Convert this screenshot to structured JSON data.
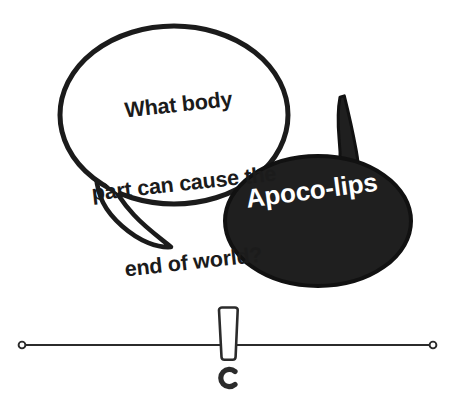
{
  "canvas": {
    "width": 461,
    "height": 411,
    "background_color": "#ffffff"
  },
  "comic": {
    "title_alt": "Apoco-lips pun joke comic with two speech bubbles",
    "question_bubble": {
      "name": "question-speech-bubble",
      "style": "outlined-white-oval-with-curved-tail",
      "fill_color": "#ffffff",
      "stroke_color": "#1b1b1b",
      "text_color": "#1b1b1b",
      "lines": [
        "What body",
        "part can cause the",
        "end of world?"
      ],
      "full_text": "What body part can cause the end of world?",
      "rotation_deg": -6.2
    },
    "answer_bubble": {
      "name": "answer-speech-bubble",
      "style": "solid-black-oval-with-horn-tail",
      "fill_color": "#1f1f1f",
      "stroke_color": "#111111",
      "text_color": "#ffffff",
      "text": "Apoco-lips",
      "rotation_deg": -7.5
    }
  },
  "divider": {
    "name": "exclamation-rule-divider",
    "line_color": "#2b2b2b",
    "endpoint_marker": "ring",
    "center_ornament": "exclamation-mark",
    "left_endpoint_x": 22,
    "right_endpoint_x": 433,
    "line_y": 345
  }
}
